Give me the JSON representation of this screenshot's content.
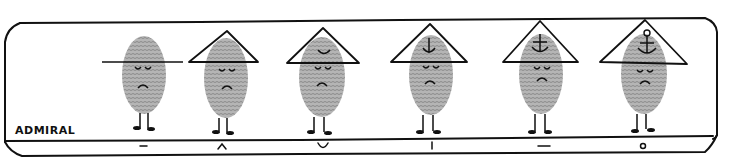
{
  "caption": "ADMIRAL",
  "colors": {
    "ink": "#111111",
    "fingerprint": "#9a9a9a",
    "fingerprint_ridge": "#6e6e6e",
    "background": "#ffffff"
  },
  "figures": [
    {
      "index": 1,
      "hat": "flat-brim-line",
      "hat_emblem": "none",
      "label_symbol": "–",
      "mood": "sad"
    },
    {
      "index": 2,
      "hat": "triangle",
      "hat_emblem": "none",
      "label_symbol": "^",
      "mood": "sad"
    },
    {
      "index": 3,
      "hat": "triangle",
      "hat_emblem": "u-curve",
      "label_symbol": "∪",
      "mood": "sad"
    },
    {
      "index": 4,
      "hat": "triangle",
      "hat_emblem": "anchor-shank",
      "label_symbol": "|",
      "mood": "sad"
    },
    {
      "index": 5,
      "hat": "triangle",
      "hat_emblem": "anchor-with-crossbar",
      "label_symbol": "—",
      "mood": "sad"
    },
    {
      "index": 6,
      "hat": "triangle",
      "hat_emblem": "full-anchor-with-ring",
      "label_symbol": "o",
      "mood": "sad"
    }
  ]
}
